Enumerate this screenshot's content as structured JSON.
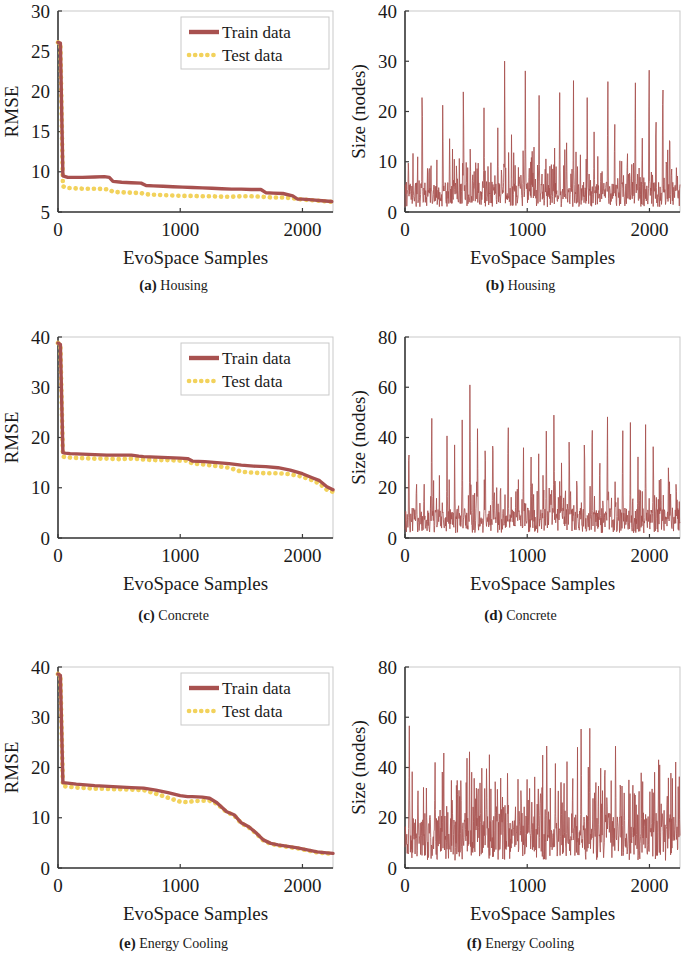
{
  "figure": {
    "xlabel": "EvoSpace Samples",
    "legend": {
      "train": "Train data",
      "test": "Test data"
    },
    "colors": {
      "train": "#a8514f",
      "test": "#f2d25c",
      "axis": "#3a3a3a",
      "box": "#c9c9c9"
    }
  },
  "panels": [
    {
      "tag": "(a)",
      "name": "Housing",
      "ylabel": "RMSE",
      "yticks": [
        "5",
        "10",
        "15",
        "20",
        "25",
        "30"
      ],
      "xticks": [
        "0",
        "1000",
        "2000"
      ],
      "legend": true
    },
    {
      "tag": "(b)",
      "name": "Housing",
      "ylabel": "Size (nodes)",
      "yticks": [
        "0",
        "10",
        "20",
        "30",
        "40"
      ],
      "xticks": [
        "0",
        "1000",
        "2000"
      ],
      "legend": false
    },
    {
      "tag": "(c)",
      "name": "Concrete",
      "ylabel": "RMSE",
      "yticks": [
        "0",
        "10",
        "20",
        "30",
        "40"
      ],
      "xticks": [
        "0",
        "1000",
        "2000"
      ],
      "legend": true
    },
    {
      "tag": "(d)",
      "name": "Concrete",
      "ylabel": "Size (nodes)",
      "yticks": [
        "0",
        "20",
        "40",
        "60",
        "80"
      ],
      "xticks": [
        "0",
        "1000",
        "2000"
      ],
      "legend": false
    },
    {
      "tag": "(e)",
      "name": "Energy Cooling",
      "ylabel": "RMSE",
      "yticks": [
        "0",
        "10",
        "20",
        "30",
        "40"
      ],
      "xticks": [
        "0",
        "1000",
        "2000"
      ],
      "legend": true
    },
    {
      "tag": "(f)",
      "name": "Energy Cooling",
      "ylabel": "Size (nodes)",
      "yticks": [
        "0",
        "20",
        "40",
        "60",
        "80"
      ],
      "xticks": [
        "0",
        "1000",
        "2000"
      ],
      "legend": false
    }
  ],
  "chart_data": [
    {
      "id": "a",
      "type": "line",
      "title": "(a) Housing",
      "xlabel": "EvoSpace Samples",
      "ylabel": "RMSE",
      "xlim": [
        0,
        2250
      ],
      "ylim": [
        5,
        30
      ],
      "yticks": [
        5,
        10,
        15,
        20,
        25,
        30
      ],
      "xticks": [
        0,
        1000,
        2000
      ],
      "grid": false,
      "legend_position": "top-right",
      "series": [
        {
          "name": "Train data",
          "style": "solid",
          "color": "#a8514f",
          "x": [
            0,
            20,
            40,
            60,
            80,
            120,
            200,
            300,
            380,
            420,
            450,
            520,
            600,
            680,
            720,
            780,
            860,
            940,
            1020,
            1100,
            1180,
            1260,
            1340,
            1420,
            1500,
            1580,
            1660,
            1700,
            1760,
            1840,
            1920,
            1960,
            2000,
            2080,
            2160,
            2240
          ],
          "y": [
            26.1,
            26.0,
            9.5,
            9.4,
            9.3,
            9.3,
            9.3,
            9.35,
            9.4,
            9.3,
            8.8,
            8.7,
            8.65,
            8.6,
            8.3,
            8.25,
            8.2,
            8.15,
            8.1,
            8.05,
            8.0,
            7.95,
            7.9,
            7.85,
            7.85,
            7.8,
            7.8,
            7.4,
            7.35,
            7.3,
            7.0,
            6.6,
            6.6,
            6.5,
            6.4,
            6.3
          ]
        },
        {
          "name": "Test data",
          "style": "dotted",
          "color": "#f2d25c",
          "x": [
            0,
            20,
            40,
            60,
            80,
            120,
            200,
            300,
            380,
            420,
            450,
            520,
            600,
            680,
            720,
            780,
            860,
            940,
            1020,
            1100,
            1180,
            1260,
            1340,
            1420,
            1500,
            1580,
            1660,
            1700,
            1760,
            1840,
            1920,
            1960,
            2000,
            2080,
            2160,
            2240
          ],
          "y": [
            26.1,
            26.0,
            8.2,
            8.1,
            8.0,
            7.95,
            7.9,
            7.9,
            7.85,
            7.8,
            7.5,
            7.45,
            7.4,
            7.35,
            7.2,
            7.15,
            7.1,
            7.05,
            7.0,
            7.0,
            6.95,
            6.95,
            6.9,
            6.9,
            6.95,
            6.95,
            6.9,
            6.85,
            6.8,
            6.8,
            6.7,
            6.6,
            6.55,
            6.45,
            6.35,
            6.25
          ]
        }
      ]
    },
    {
      "id": "b",
      "type": "line",
      "title": "(b) Housing",
      "xlabel": "EvoSpace Samples",
      "ylabel": "Size (nodes)",
      "xlim": [
        0,
        2250
      ],
      "ylim": [
        0,
        40
      ],
      "yticks": [
        0,
        10,
        20,
        30,
        40
      ],
      "xticks": [
        0,
        1000,
        2000
      ],
      "grid": false,
      "legend_position": "none",
      "description": "Dense high-frequency sawtooth; baseline 1-6 nodes with periodic spikes",
      "series": [
        {
          "name": "Size",
          "style": "solid",
          "color": "#a8514f",
          "baseline": [
            1,
            6
          ],
          "spike_peaks": [
            14,
            9,
            35,
            12,
            8,
            29,
            18,
            11,
            32,
            15,
            9,
            27,
            13,
            20,
            35,
            17,
            10,
            31,
            14,
            24,
            12,
            9,
            25,
            16,
            29,
            13,
            28,
            18,
            11,
            31,
            22,
            14,
            9,
            36,
            20,
            39,
            26,
            35,
            21,
            12
          ],
          "n_points": 2250
        }
      ]
    },
    {
      "id": "c",
      "type": "line",
      "title": "(c) Concrete",
      "xlabel": "EvoSpace Samples",
      "ylabel": "RMSE",
      "xlim": [
        0,
        2250
      ],
      "ylim": [
        0,
        40
      ],
      "yticks": [
        0,
        10,
        20,
        30,
        40
      ],
      "xticks": [
        0,
        1000,
        2000
      ],
      "grid": false,
      "legend_position": "top-right",
      "series": [
        {
          "name": "Train data",
          "style": "solid",
          "color": "#a8514f",
          "x": [
            0,
            20,
            40,
            60,
            100,
            200,
            300,
            400,
            500,
            600,
            660,
            700,
            800,
            900,
            1000,
            1060,
            1100,
            1200,
            1300,
            1400,
            1500,
            1600,
            1700,
            1800,
            1900,
            2000,
            2080,
            2140,
            2200,
            2250
          ],
          "y": [
            38.8,
            38.5,
            17.0,
            16.9,
            16.8,
            16.7,
            16.6,
            16.5,
            16.5,
            16.5,
            16.3,
            16.2,
            16.1,
            16.0,
            15.9,
            15.8,
            15.3,
            15.2,
            15.0,
            14.8,
            14.5,
            14.3,
            14.2,
            14.0,
            13.5,
            12.8,
            12.0,
            11.4,
            10.2,
            9.6
          ]
        },
        {
          "name": "Test data",
          "style": "dotted",
          "color": "#f2d25c",
          "x": [
            0,
            20,
            40,
            60,
            100,
            200,
            300,
            400,
            500,
            600,
            660,
            700,
            800,
            900,
            1000,
            1060,
            1100,
            1200,
            1300,
            1400,
            1500,
            1600,
            1700,
            1800,
            1900,
            2000,
            2080,
            2140,
            2200,
            2250
          ],
          "y": [
            38.8,
            38.5,
            16.2,
            16.1,
            16.0,
            15.9,
            15.8,
            15.8,
            15.7,
            15.8,
            15.7,
            15.6,
            15.5,
            15.5,
            15.4,
            15.4,
            14.8,
            14.6,
            14.3,
            14.0,
            13.2,
            13.0,
            12.9,
            12.9,
            12.7,
            12.2,
            11.5,
            10.8,
            9.6,
            9.2
          ]
        }
      ]
    },
    {
      "id": "d",
      "type": "line",
      "title": "(d) Concrete",
      "xlabel": "EvoSpace Samples",
      "ylabel": "Size (nodes)",
      "xlim": [
        0,
        2250
      ],
      "ylim": [
        0,
        80
      ],
      "yticks": [
        0,
        20,
        40,
        60,
        80
      ],
      "xticks": [
        0,
        1000,
        2000
      ],
      "grid": false,
      "legend_position": "none",
      "description": "Dense sawtooth; baseline 2-12 nodes with periodic spikes up to 74",
      "series": [
        {
          "name": "Size",
          "style": "solid",
          "color": "#a8514f",
          "baseline": [
            2,
            12
          ],
          "spike_peaks": [
            47,
            30,
            25,
            56,
            29,
            45,
            38,
            52,
            74,
            55,
            48,
            58,
            30,
            59,
            25,
            40,
            39,
            35,
            42,
            58,
            33,
            47,
            30,
            52,
            61,
            44,
            59,
            30,
            50,
            48,
            36,
            51,
            44,
            28,
            35,
            30
          ],
          "n_points": 2250
        }
      ]
    },
    {
      "id": "e",
      "type": "line",
      "title": "(e) Energy Cooling",
      "xlabel": "EvoSpace Samples",
      "ylabel": "RMSE",
      "xlim": [
        0,
        2250
      ],
      "ylim": [
        0,
        40
      ],
      "yticks": [
        0,
        10,
        20,
        30,
        40
      ],
      "xticks": [
        0,
        1000,
        2000
      ],
      "grid": false,
      "legend_position": "top-right",
      "series": [
        {
          "name": "Train data",
          "style": "solid",
          "color": "#a8514f",
          "x": [
            0,
            20,
            40,
            80,
            150,
            300,
            450,
            600,
            700,
            800,
            900,
            1000,
            1060,
            1100,
            1180,
            1240,
            1300,
            1380,
            1440,
            1500,
            1560,
            1620,
            1680,
            1740,
            1800,
            1880,
            1960,
            2040,
            2120,
            2200,
            2250
          ],
          "y": [
            38.6,
            38.3,
            17.0,
            16.9,
            16.7,
            16.4,
            16.2,
            16.0,
            15.9,
            15.5,
            15.0,
            14.4,
            14.2,
            14.2,
            14.1,
            13.9,
            13.0,
            11.2,
            10.6,
            9.0,
            8.2,
            7.0,
            5.6,
            4.9,
            4.6,
            4.3,
            4.0,
            3.6,
            3.2,
            3.0,
            2.9
          ]
        },
        {
          "name": "Test data",
          "style": "dotted",
          "color": "#f2d25c",
          "x": [
            0,
            20,
            40,
            80,
            150,
            300,
            450,
            600,
            700,
            800,
            900,
            1000,
            1060,
            1100,
            1180,
            1240,
            1300,
            1380,
            1440,
            1500,
            1560,
            1620,
            1680,
            1740,
            1800,
            1880,
            1960,
            2040,
            2120,
            2200,
            2250
          ],
          "y": [
            38.6,
            38.3,
            16.3,
            16.2,
            16.0,
            15.8,
            15.7,
            15.6,
            15.5,
            14.8,
            14.0,
            13.2,
            13.1,
            13.3,
            13.4,
            13.4,
            12.8,
            11.1,
            10.5,
            8.9,
            8.1,
            6.9,
            5.5,
            4.8,
            4.5,
            4.2,
            3.9,
            3.5,
            3.1,
            2.9,
            2.8
          ]
        }
      ]
    },
    {
      "id": "f",
      "type": "line",
      "title": "(f) Energy Cooling",
      "xlabel": "EvoSpace Samples",
      "ylabel": "Size (nodes)",
      "xlim": [
        0,
        2250
      ],
      "ylim": [
        0,
        80
      ],
      "yticks": [
        0,
        20,
        40,
        60,
        80
      ],
      "xticks": [
        0,
        1000,
        2000
      ],
      "grid": false,
      "legend_position": "none",
      "description": "Dense sawtooth; elevated baseline 5-25 nodes early, spikes to 62",
      "series": [
        {
          "name": "Size",
          "style": "solid",
          "color": "#a8514f",
          "baseline": [
            3,
            22
          ],
          "spike_peaks": [
            62,
            35,
            33,
            45,
            53,
            38,
            42,
            47,
            41,
            52,
            36,
            30,
            24,
            40,
            38,
            36,
            59,
            45,
            40,
            44,
            61,
            60,
            48,
            38,
            52,
            30,
            44,
            40,
            38,
            51,
            35,
            42
          ],
          "n_points": 2250
        }
      ]
    }
  ]
}
